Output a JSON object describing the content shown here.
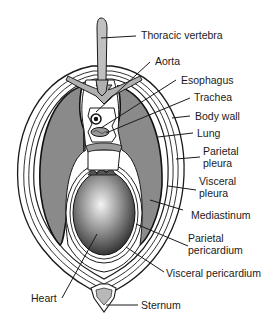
{
  "diagram": {
    "type": "anatomical cross-section of the thorax",
    "colors": {
      "lung": "#8a8a8a",
      "membrane": "#ffffff",
      "outline": "#1a1a1a",
      "vertebra": "#b0b0b0",
      "heart_center": "#f2f2f2",
      "heart_edge": "#2a2a2a"
    },
    "labels": [
      {
        "id": "thoracic-vertebra",
        "text": "Thoracic vertebra"
      },
      {
        "id": "aorta",
        "text": "Aorta"
      },
      {
        "id": "esophagus",
        "text": "Esophagus"
      },
      {
        "id": "trachea",
        "text": "Trachea"
      },
      {
        "id": "body-wall",
        "text": "Body wall"
      },
      {
        "id": "lung",
        "text": "Lung"
      },
      {
        "id": "parietal-pleura",
        "text": "Parietal",
        "text2": "pleura"
      },
      {
        "id": "visceral-pleura",
        "text": "Visceral",
        "text2": "pleura"
      },
      {
        "id": "mediastinum",
        "text": "Mediastinum"
      },
      {
        "id": "parietal-pericardium",
        "text": "Parietal",
        "text2": "pericardium"
      },
      {
        "id": "visceral-pericardium",
        "text": "Visceral pericardium"
      },
      {
        "id": "heart",
        "text": "Heart"
      },
      {
        "id": "sternum",
        "text": "Sternum"
      }
    ]
  }
}
